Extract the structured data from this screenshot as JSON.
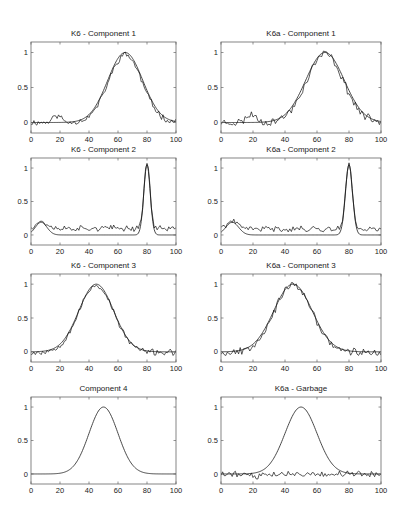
{
  "figure": {
    "width": 404,
    "height": 523,
    "line_color": "#222222",
    "frame_color": "#666666"
  },
  "chart_data": [
    {
      "type": "line",
      "title": "K6 - Component 1",
      "xlabel": "",
      "ylabel": "",
      "xlim": [
        0,
        100
      ],
      "ylim": [
        -0.15,
        1.15
      ],
      "xticks": [
        0,
        20,
        40,
        60,
        80,
        100
      ],
      "yticks": [
        0,
        0.5,
        1
      ],
      "ytick_labels": [
        "0",
        "0.5",
        "1"
      ],
      "grid": false,
      "box": {
        "left": 31,
        "top": 42,
        "right": 176,
        "bottom": 133
      },
      "series": [
        {
          "name": "true",
          "kind": "gaussian",
          "center": 65,
          "width": 12,
          "amplitude": 1.0,
          "baseline": 0
        },
        {
          "name": "estimate",
          "kind": "noisy",
          "center": 65,
          "width": 11.5,
          "amplitude": 0.97,
          "baseline": 0,
          "bumps": [
            {
              "center": 18,
              "width": 3,
              "amplitude": 0.1
            }
          ],
          "noise": 0.035,
          "seed": 11
        }
      ]
    },
    {
      "type": "line",
      "title": "K6a - Component 1",
      "xlabel": "",
      "ylabel": "",
      "xlim": [
        0,
        100
      ],
      "ylim": [
        -0.15,
        1.15
      ],
      "xticks": [
        0,
        20,
        40,
        60,
        80,
        100
      ],
      "yticks": [
        0,
        0.5,
        1
      ],
      "ytick_labels": [
        "0",
        "0.5",
        "1"
      ],
      "grid": false,
      "box": {
        "left": 221,
        "top": 42,
        "right": 381,
        "bottom": 133
      },
      "series": [
        {
          "name": "true",
          "kind": "gaussian",
          "center": 65,
          "width": 12,
          "amplitude": 1.0,
          "baseline": 0
        },
        {
          "name": "estimate",
          "kind": "noisy",
          "center": 65,
          "width": 11.5,
          "amplitude": 0.98,
          "baseline": 0,
          "bumps": [
            {
              "center": 19,
              "width": 3,
              "amplitude": 0.12
            }
          ],
          "noise": 0.045,
          "seed": 23
        }
      ]
    },
    {
      "type": "line",
      "title": "K6 - Component 2",
      "xlabel": "",
      "ylabel": "",
      "xlim": [
        0,
        100
      ],
      "ylim": [
        -0.15,
        1.15
      ],
      "xticks": [
        0,
        20,
        40,
        60,
        80,
        100
      ],
      "yticks": [
        0,
        0.5,
        1
      ],
      "ytick_labels": [
        "0",
        "0.5",
        "1"
      ],
      "grid": false,
      "box": {
        "left": 31,
        "top": 158,
        "right": 176,
        "bottom": 245
      },
      "series": [
        {
          "name": "true",
          "kind": "gaussian",
          "center": 80,
          "width": 2.2,
          "amplitude": 1.05,
          "baseline": 0,
          "bumps": [
            {
              "center": 7,
              "width": 4,
              "amplitude": 0.19
            }
          ]
        },
        {
          "name": "estimate",
          "kind": "noisy",
          "center": 80,
          "width": 2.0,
          "amplitude": 1.0,
          "baseline": 0.1,
          "bumps": [
            {
              "center": 7,
              "width": 4,
              "amplitude": 0.1
            }
          ],
          "noise": 0.035,
          "seed": 37
        }
      ]
    },
    {
      "type": "line",
      "title": "K6a - Component 2",
      "xlabel": "",
      "ylabel": "",
      "xlim": [
        0,
        100
      ],
      "ylim": [
        -0.15,
        1.15
      ],
      "xticks": [
        0,
        20,
        40,
        60,
        80,
        100
      ],
      "yticks": [
        0,
        0.5,
        1
      ],
      "ytick_labels": [
        "0",
        "0.5",
        "1"
      ],
      "grid": false,
      "box": {
        "left": 221,
        "top": 158,
        "right": 381,
        "bottom": 245
      },
      "series": [
        {
          "name": "true",
          "kind": "gaussian",
          "center": 80,
          "width": 2.2,
          "amplitude": 1.05,
          "baseline": 0,
          "bumps": [
            {
              "center": 7,
              "width": 4,
              "amplitude": 0.19
            }
          ]
        },
        {
          "name": "estimate",
          "kind": "noisy",
          "center": 80,
          "width": 2.0,
          "amplitude": 1.0,
          "baseline": 0.09,
          "bumps": [
            {
              "center": 7,
              "width": 4,
              "amplitude": 0.1
            }
          ],
          "noise": 0.035,
          "seed": 41
        }
      ]
    },
    {
      "type": "line",
      "title": "K6 - Component 3",
      "xlabel": "",
      "ylabel": "",
      "xlim": [
        0,
        100
      ],
      "ylim": [
        -0.15,
        1.15
      ],
      "xticks": [
        0,
        20,
        40,
        60,
        80,
        100
      ],
      "yticks": [
        0,
        0.5,
        1
      ],
      "ytick_labels": [
        "0",
        "0.5",
        "1"
      ],
      "grid": false,
      "box": {
        "left": 31,
        "top": 274,
        "right": 176,
        "bottom": 362
      },
      "series": [
        {
          "name": "true",
          "kind": "gaussian",
          "center": 45,
          "width": 12,
          "amplitude": 1.0,
          "baseline": 0
        },
        {
          "name": "estimate",
          "kind": "noisy",
          "center": 45,
          "width": 12,
          "amplitude": 0.99,
          "baseline": -0.01,
          "noise": 0.035,
          "seed": 53
        }
      ]
    },
    {
      "type": "line",
      "title": "K6a - Component 3",
      "xlabel": "",
      "ylabel": "",
      "xlim": [
        0,
        100
      ],
      "ylim": [
        -0.15,
        1.15
      ],
      "xticks": [
        0,
        20,
        40,
        60,
        80,
        100
      ],
      "yticks": [
        0,
        0.5,
        1
      ],
      "ytick_labels": [
        "0",
        "0.5",
        "1"
      ],
      "grid": false,
      "box": {
        "left": 221,
        "top": 274,
        "right": 381,
        "bottom": 362
      },
      "series": [
        {
          "name": "true",
          "kind": "gaussian",
          "center": 45,
          "width": 12,
          "amplitude": 1.0,
          "baseline": 0
        },
        {
          "name": "estimate",
          "kind": "noisy",
          "center": 45,
          "width": 12,
          "amplitude": 0.99,
          "baseline": -0.01,
          "noise": 0.045,
          "seed": 67
        }
      ]
    },
    {
      "type": "line",
      "title": "Component 4",
      "xlabel": "",
      "ylabel": "",
      "xlim": [
        0,
        100
      ],
      "ylim": [
        -0.15,
        1.15
      ],
      "xticks": [
        0,
        20,
        40,
        60,
        80,
        100
      ],
      "yticks": [
        0,
        0.5,
        1
      ],
      "ytick_labels": [
        "0",
        "0.5",
        "1"
      ],
      "grid": false,
      "box": {
        "left": 31,
        "top": 397,
        "right": 176,
        "bottom": 484
      },
      "series": [
        {
          "name": "true",
          "kind": "gaussian",
          "center": 50,
          "width": 10,
          "amplitude": 1.0,
          "baseline": 0
        }
      ]
    },
    {
      "type": "line",
      "title": "K6a - Garbage",
      "xlabel": "",
      "ylabel": "",
      "xlim": [
        0,
        100
      ],
      "ylim": [
        -0.15,
        1.15
      ],
      "xticks": [
        0,
        20,
        40,
        60,
        80,
        100
      ],
      "yticks": [
        0,
        0.5,
        1
      ],
      "ytick_labels": [
        "0",
        "0.5",
        "1"
      ],
      "grid": false,
      "box": {
        "left": 221,
        "top": 397,
        "right": 381,
        "bottom": 484
      },
      "series": [
        {
          "name": "true",
          "kind": "gaussian",
          "center": 50,
          "width": 10,
          "amplitude": 1.0,
          "baseline": 0
        },
        {
          "name": "garbage",
          "kind": "noisy",
          "center": 50,
          "width": 10,
          "amplitude": 0.0,
          "baseline": 0.0,
          "bumps": [
            {
              "center": 22,
              "width": 1.2,
              "amplitude": -0.08
            }
          ],
          "noise": 0.035,
          "seed": 79
        }
      ]
    }
  ]
}
